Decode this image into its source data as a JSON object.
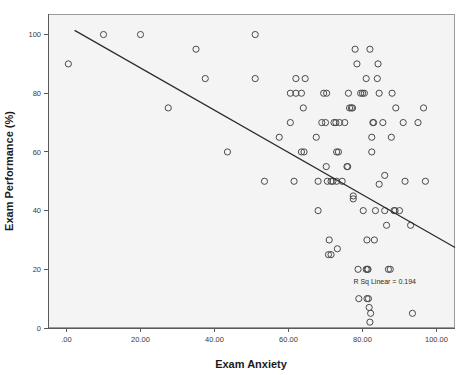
{
  "chart_data": {
    "type": "scatter",
    "title": "",
    "xlabel": "Exam Anxiety",
    "ylabel": "Exam Performance (%)",
    "xlim": [
      -5,
      105
    ],
    "ylim": [
      0,
      107
    ],
    "grid": false,
    "legend": "none",
    "xticks": [
      0,
      20,
      40,
      60,
      80,
      100
    ],
    "xtick_labels": [
      ".00",
      "20.00",
      "40.00",
      "60.00",
      "80.00",
      "100.00"
    ],
    "yticks": [
      0,
      20,
      40,
      60,
      80,
      100
    ],
    "ytick_labels": [
      "0",
      "20",
      "40",
      "60",
      "80",
      "100"
    ],
    "annotations": [
      {
        "name": "r-squared-label",
        "text": "R Sq Linear = 0.194",
        "x": 86,
        "y": 15
      }
    ],
    "fit_line": {
      "name": "linear-fit-line",
      "type": "linear",
      "slope": -0.72,
      "intercept": 103.0,
      "x_start": 2.2,
      "x_end": 105.0,
      "r_squared": 0.194
    },
    "marker": {
      "shape": "open-circle",
      "radius": 3.1,
      "edge_color": "#4a4a4a",
      "fill_color": "none"
    },
    "points": [
      [
        0.5,
        90
      ],
      [
        10.0,
        100
      ],
      [
        20.0,
        100
      ],
      [
        35.0,
        95
      ],
      [
        37.5,
        85
      ],
      [
        27.5,
        75
      ],
      [
        43.5,
        60
      ],
      [
        51.0,
        100
      ],
      [
        51.0,
        85
      ],
      [
        53.5,
        50
      ],
      [
        57.5,
        65
      ],
      [
        60.5,
        80
      ],
      [
        60.5,
        70
      ],
      [
        61.5,
        50
      ],
      [
        62.0,
        80
      ],
      [
        62.0,
        85
      ],
      [
        63.5,
        80
      ],
      [
        63.5,
        60
      ],
      [
        64.2,
        60
      ],
      [
        64.5,
        85
      ],
      [
        64.0,
        75
      ],
      [
        67.5,
        65
      ],
      [
        68.0,
        40
      ],
      [
        68.0,
        50
      ],
      [
        69.0,
        70
      ],
      [
        69.5,
        80
      ],
      [
        70.3,
        80
      ],
      [
        70.0,
        70
      ],
      [
        70.2,
        55
      ],
      [
        70.5,
        50
      ],
      [
        71.0,
        30
      ],
      [
        70.8,
        25
      ],
      [
        71.5,
        25
      ],
      [
        71.5,
        50
      ],
      [
        72.0,
        50
      ],
      [
        72.3,
        70
      ],
      [
        72.8,
        70
      ],
      [
        73.0,
        50
      ],
      [
        73.0,
        60
      ],
      [
        73.2,
        27
      ],
      [
        73.5,
        60
      ],
      [
        73.8,
        70
      ],
      [
        74.5,
        50
      ],
      [
        75.2,
        70
      ],
      [
        75.8,
        55
      ],
      [
        76.0,
        55
      ],
      [
        76.2,
        80
      ],
      [
        76.5,
        75
      ],
      [
        77.0,
        75
      ],
      [
        77.3,
        75
      ],
      [
        77.5,
        45
      ],
      [
        77.5,
        44
      ],
      [
        78.0,
        95
      ],
      [
        78.5,
        90
      ],
      [
        78.8,
        20
      ],
      [
        79.0,
        10
      ],
      [
        79.5,
        80
      ],
      [
        80.0,
        80
      ],
      [
        80.5,
        80
      ],
      [
        80.2,
        40
      ],
      [
        81.0,
        85
      ],
      [
        81.0,
        20
      ],
      [
        81.3,
        20
      ],
      [
        81.5,
        20
      ],
      [
        81.2,
        10
      ],
      [
        81.6,
        10
      ],
      [
        81.2,
        30
      ],
      [
        81.8,
        7
      ],
      [
        82.0,
        2
      ],
      [
        82.2,
        5
      ],
      [
        82.0,
        95
      ],
      [
        82.5,
        60
      ],
      [
        82.5,
        65
      ],
      [
        82.8,
        70
      ],
      [
        83.0,
        70
      ],
      [
        83.2,
        30
      ],
      [
        83.5,
        40
      ],
      [
        84.0,
        85
      ],
      [
        84.2,
        90
      ],
      [
        84.5,
        80
      ],
      [
        84.5,
        49
      ],
      [
        85.5,
        70
      ],
      [
        86.0,
        52
      ],
      [
        86.0,
        40
      ],
      [
        86.5,
        35
      ],
      [
        87.0,
        20
      ],
      [
        87.5,
        20
      ],
      [
        87.8,
        65
      ],
      [
        88.0,
        80
      ],
      [
        88.5,
        40
      ],
      [
        88.8,
        40
      ],
      [
        89.0,
        75
      ],
      [
        90.0,
        40
      ],
      [
        91.0,
        70
      ],
      [
        91.5,
        50
      ],
      [
        93.0,
        35
      ],
      [
        93.5,
        5
      ],
      [
        95.0,
        70
      ],
      [
        96.5,
        75
      ],
      [
        97.0,
        50
      ]
    ]
  },
  "axes": {
    "x_axis_name": "exam-anxiety-axis",
    "y_axis_name": "exam-performance-axis"
  }
}
